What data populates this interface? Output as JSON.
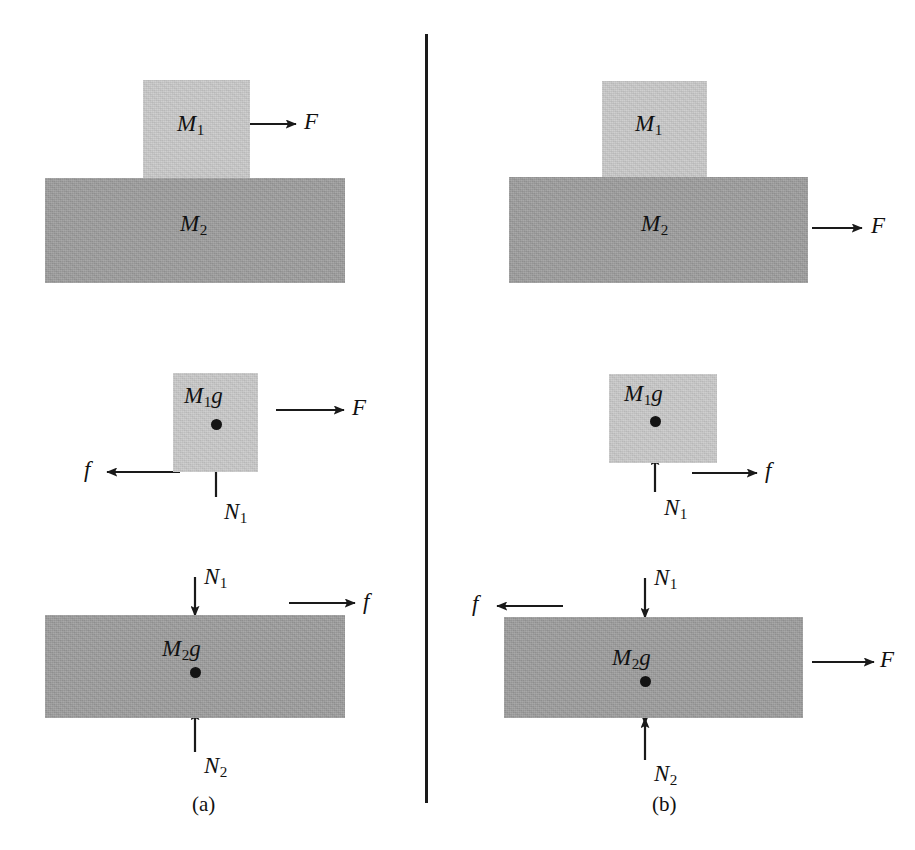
{
  "figure": {
    "background_color": "#ffffff",
    "block_colors": {
      "upper_block": "#c9c9c9",
      "lower_block": "#9c9c9c"
    },
    "line_color": "#1a1a1a",
    "divider": {
      "x": 425,
      "y_top": 34,
      "y_bottom": 803,
      "width": 3
    }
  },
  "panels": {
    "a": {
      "caption": "(a)",
      "situation": {
        "label_m1": "M",
        "sub_m1": "1",
        "label_m2": "M",
        "sub_m2": "2",
        "force_label": "F",
        "force_applied_to": "M1",
        "force_direction": "right"
      },
      "fbd_m1": {
        "weight_label": "M",
        "weight_sub": "1",
        "weight_suffix": "g",
        "normal_label": "N",
        "normal_sub": "1",
        "friction_label": "f",
        "friction_direction": "left",
        "applied_force_label": "F",
        "applied_force_direction": "right"
      },
      "fbd_m2": {
        "weight_label": "M",
        "weight_sub": "2",
        "weight_suffix": "g",
        "normal_top_label": "N",
        "normal_top_sub": "1",
        "normal_bottom_label": "N",
        "normal_bottom_sub": "2",
        "friction_label": "f",
        "friction_direction": "right"
      }
    },
    "b": {
      "caption": "(b)",
      "situation": {
        "label_m1": "M",
        "sub_m1": "1",
        "label_m2": "M",
        "sub_m2": "2",
        "force_label": "F",
        "force_applied_to": "M2",
        "force_direction": "right"
      },
      "fbd_m1": {
        "weight_label": "M",
        "weight_sub": "1",
        "weight_suffix": "g",
        "normal_label": "N",
        "normal_sub": "1",
        "friction_label": "f",
        "friction_direction": "right"
      },
      "fbd_m2": {
        "weight_label": "M",
        "weight_sub": "2",
        "weight_suffix": "g",
        "normal_top_label": "N",
        "normal_top_sub": "1",
        "normal_bottom_label": "N",
        "normal_bottom_sub": "2",
        "friction_label": "f",
        "friction_direction": "left",
        "applied_force_label": "F",
        "applied_force_direction": "right"
      }
    }
  }
}
